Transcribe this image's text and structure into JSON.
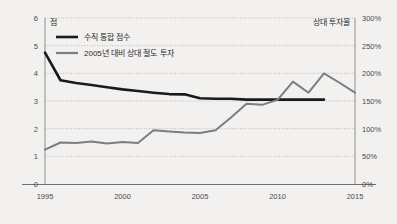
{
  "chart_data": {
    "type": "line",
    "title": "",
    "xlabel": "",
    "x": [
      1995,
      1996,
      1997,
      1998,
      1999,
      2000,
      2001,
      2002,
      2003,
      2004,
      2005,
      2006,
      2007,
      2008,
      2009,
      2010,
      2011,
      2012,
      2013,
      2014,
      2015
    ],
    "series": [
      {
        "name": "수직 통합 점수",
        "axis": "left",
        "color": "#1a1a1a",
        "values": [
          4.75,
          3.75,
          3.65,
          3.58,
          3.5,
          3.42,
          3.36,
          3.3,
          3.25,
          3.24,
          3.1,
          3.08,
          3.08,
          3.05,
          3.05,
          3.05,
          3.05,
          3.05,
          3.05,
          null,
          null
        ]
      },
      {
        "name": "2005년 대비 상대 철도 투자",
        "axis": "right",
        "color": "#7d7d7d",
        "values": [
          62,
          75,
          74,
          77,
          73,
          76,
          74,
          97,
          95,
          93,
          92,
          97,
          120,
          145,
          143,
          152,
          185,
          165,
          200,
          183,
          165
        ]
      }
    ],
    "left_axis": {
      "unit_label": "점",
      "ticks": [
        0,
        1,
        2,
        3,
        4,
        5,
        6
      ],
      "tick_labels": [
        "0",
        "1",
        "2",
        "3",
        "4",
        "5",
        "6"
      ],
      "min": 0,
      "max": 6
    },
    "right_axis": {
      "unit_label": "상대 투자율",
      "ticks": [
        0,
        50,
        100,
        150,
        200,
        250,
        300
      ],
      "tick_labels": [
        "0%",
        "50%",
        "100%",
        "150%",
        "200%",
        "250%",
        "300%"
      ],
      "min": 0,
      "max": 300
    },
    "x_axis": {
      "ticks": [
        1995,
        2000,
        2005,
        2010,
        2015
      ],
      "tick_labels": [
        "1995",
        "2000",
        "2005",
        "2010",
        "2015"
      ],
      "min": 1995,
      "max": 2015
    },
    "legend": {
      "position": "top-left",
      "entries": [
        {
          "label": "수직 통합 점수",
          "color": "#1a1a1a"
        },
        {
          "label": "2005년 대비 상대 철도 투자",
          "color": "#7d7d7d"
        }
      ]
    },
    "grid": true,
    "background": "#f2f1ef"
  }
}
